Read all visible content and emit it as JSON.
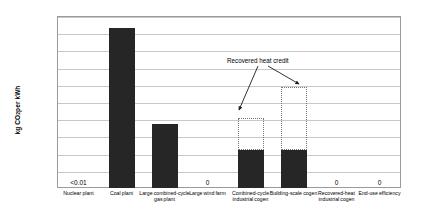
{
  "chart_data": {
    "type": "bar",
    "title": "",
    "xlabel": "",
    "ylabel": "kg CO2 per kWh",
    "ylabel_parts": {
      "pre": "kg CO",
      "sub": "2",
      "post": " per kWh"
    },
    "ylim": [
      0,
      1
    ],
    "ytick_labels": [
      "0",
      "0.1",
      "0.2",
      "0.3",
      "0.4",
      "0.5",
      "0.6",
      "0.7",
      "0.8",
      "0.9",
      "1"
    ],
    "ytick_values": [
      0,
      0.1,
      0.2,
      0.3,
      0.4,
      0.5,
      0.6,
      0.7,
      0.8,
      0.9,
      1
    ],
    "grid": true,
    "legend": "none",
    "categories": [
      "Nuclear plant",
      "Coal plant",
      "Large combined-cycle gas plant",
      "Large wind farm",
      "Combined-cycle industrial cogen",
      "Building-scale cogen",
      "Recovered-heat industrial cogen",
      "End-use efficiency"
    ],
    "values": [
      0.005,
      0.93,
      0.37,
      0,
      0.22,
      0.22,
      0,
      0
    ],
    "series": [
      {
        "name": "Direct CO2 emissions",
        "values": [
          0.005,
          0.93,
          0.37,
          0,
          0.22,
          0.22,
          0,
          0
        ]
      },
      {
        "name": "Recovered heat credit (gross, dotted outline)",
        "values": [
          null,
          null,
          null,
          null,
          0.41,
          0.59,
          null,
          null
        ]
      }
    ],
    "data_labels": [
      {
        "category": "Nuclear plant",
        "text": "<0.01"
      },
      {
        "category": "Large wind farm",
        "text": "0"
      },
      {
        "category": "Recovered-heat industrial cogen",
        "text": "0"
      },
      {
        "category": "End-use efficiency",
        "text": "0"
      }
    ],
    "annotations": [
      {
        "text": "Recovered heat credit",
        "points_to": [
          "Combined-cycle industrial cogen",
          "Building-scale cogen"
        ]
      }
    ],
    "colors": {
      "bar_fill": "#262626",
      "ghost_outline": "#777777",
      "gridline": "#c8c8c8",
      "axis": "#9a9a9a",
      "text": "#000000",
      "background": "#ffffff"
    }
  }
}
